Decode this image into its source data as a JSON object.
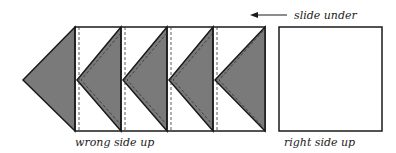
{
  "diagram": {
    "labels": {
      "slide_under": "slide under",
      "wrong_side_up": "wrong side up",
      "right_side_up": "right side up"
    },
    "colors": {
      "fill_dark": "#7a7a7a",
      "stroke": "#1a1a1a",
      "background": "#ffffff"
    },
    "units": [
      {
        "x": 75,
        "w": 46
      },
      {
        "x": 121,
        "w": 46
      },
      {
        "x": 167,
        "w": 46
      },
      {
        "x": 213,
        "w": 52
      }
    ]
  }
}
